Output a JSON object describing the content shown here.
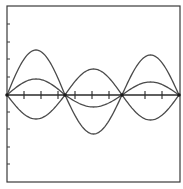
{
  "figure": {
    "type": "standing-wave-diagram",
    "colors": {
      "background": "#ffffff",
      "frame": "#3a3a3a",
      "curve": "#4a4a4a",
      "axis": "#2a2a2a",
      "node": "#1a1a1a"
    },
    "frame": {
      "left": 7,
      "top": 6,
      "right": 180,
      "bottom": 182
    },
    "axis_y": 95,
    "nodes_x": [
      7,
      65,
      122,
      179
    ],
    "left_ticks_y": [
      24,
      42,
      59,
      77,
      112,
      129,
      147,
      164
    ],
    "axis_ticks_x": [
      24,
      41,
      58,
      75,
      92,
      109,
      145,
      162
    ],
    "curves": [
      {
        "name": "large-amplitude-curve",
        "segments": [
          {
            "x0": 7,
            "x1": 65,
            "peak_y": 50
          },
          {
            "x0": 65,
            "x1": 122,
            "peak_y": 134
          },
          {
            "x0": 122,
            "x1": 179,
            "peak_y": 55
          }
        ]
      },
      {
        "name": "medium-amplitude-curve",
        "segments": [
          {
            "x0": 7,
            "x1": 65,
            "peak_y": 119
          },
          {
            "x0": 65,
            "x1": 122,
            "peak_y": 69
          },
          {
            "x0": 122,
            "x1": 179,
            "peak_y": 120
          }
        ]
      },
      {
        "name": "small-amplitude-curve",
        "segments": [
          {
            "x0": 7,
            "x1": 65,
            "peak_y": 79
          },
          {
            "x0": 65,
            "x1": 122,
            "peak_y": 107
          },
          {
            "x0": 122,
            "x1": 179,
            "peak_y": 82
          }
        ]
      }
    ]
  }
}
